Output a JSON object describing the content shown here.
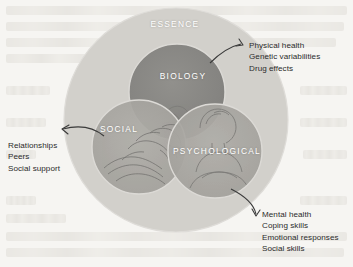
{
  "figure": {
    "type": "venn-diagram",
    "model": "biopsychosocial",
    "outer_circle": {
      "label": "ESSENCE"
    },
    "circles": [
      {
        "key": "biology",
        "label": "BIOLOGY"
      },
      {
        "key": "social",
        "label": "SOCIAL"
      },
      {
        "key": "psychological",
        "label": "PSYCHOLOGICAL"
      }
    ],
    "callouts": [
      {
        "key": "biology",
        "target": "BIOLOGY",
        "items": [
          "Physical health",
          "Genetic variabilities",
          "Drug effects"
        ]
      },
      {
        "key": "social",
        "target": "SOCIAL",
        "items": [
          "Relationships",
          "Peers",
          "Social support"
        ]
      },
      {
        "key": "psychological",
        "target": "PSYCHOLOGICAL",
        "items": [
          "Mental health",
          "Coping skills",
          "Emotional responses",
          "Social skills"
        ]
      }
    ],
    "imagery": {
      "biology": "brain-illustration",
      "social": "handshake-illustration",
      "psychological": "seated-person-illustration"
    },
    "colors": {
      "page_background": "#f6f5f2",
      "outer_circle": "#cfcdc8",
      "inner_circle": "#a9a7a2",
      "biology_circle": "#8b8a86",
      "label_text": "#ffffff",
      "callout_text": "#2b2b2b",
      "arrow": "#3a3a3a"
    }
  },
  "callout_text": {
    "biology": {
      "line1": "Physical health",
      "line2": "Genetic variabilities",
      "line3": "Drug effects"
    },
    "social": {
      "line1": "Relationships",
      "line2": "Peers",
      "line3": "Social support"
    },
    "psychological": {
      "line1": "Mental health",
      "line2": "Coping skills",
      "line3": "Emotional responses",
      "line4": "Social skills"
    }
  },
  "labels": {
    "essence": "ESSENCE",
    "biology": "BIOLOGY",
    "social": "SOCIAL",
    "psychological": "PSYCHOLOGICAL"
  }
}
